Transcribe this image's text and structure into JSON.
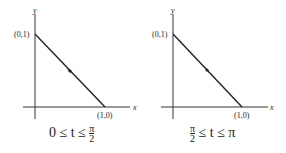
{
  "graphs": [
    {
      "axis_x_label": "x",
      "axis_y_label": "y",
      "point_start_label": "(0,1)",
      "point_end_label": "(1,0)",
      "direction": "from (0,1) to (1,0)",
      "caption": {
        "left": "0 ≤ t ≤",
        "frac_num": "π",
        "frac_den": "2",
        "right": ""
      }
    },
    {
      "axis_x_label": "x",
      "axis_y_label": "y",
      "point_start_label": "(0,1)",
      "point_end_label": "(1,0)",
      "direction": "from (1,0) to (0,1)",
      "caption": {
        "frac_num": "π",
        "frac_den": "2",
        "right": "≤ t ≤ π"
      }
    }
  ]
}
